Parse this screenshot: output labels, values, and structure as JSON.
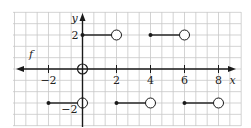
{
  "chart_data": {
    "type": "line",
    "title": "",
    "function_label": "f",
    "xlabel": "x",
    "ylabel": "y",
    "xlim": [
      -3.8,
      9.2
    ],
    "ylim": [
      -3.3,
      3.3
    ],
    "grid": true,
    "grid_step_units": 0.6667,
    "x_ticks": [
      -2,
      2,
      4,
      6,
      8
    ],
    "x_tick_labels": [
      "−2",
      "2",
      "4",
      "6",
      "8"
    ],
    "y_ticks": [
      2,
      -2
    ],
    "y_tick_labels": [
      "2",
      "−2"
    ],
    "segments": [
      {
        "x_start": -2,
        "x_end": 0,
        "y": -2,
        "start_closed": true,
        "end_closed": false
      },
      {
        "x_start": 0,
        "x_end": 2,
        "y": 2,
        "start_closed": true,
        "end_closed": false
      },
      {
        "x_start": 2,
        "x_end": 4,
        "y": -2,
        "start_closed": true,
        "end_closed": false
      },
      {
        "x_start": 4,
        "x_end": 6,
        "y": 2,
        "start_closed": true,
        "end_closed": false
      },
      {
        "x_start": 6,
        "x_end": 8,
        "y": -2,
        "start_closed": true,
        "end_closed": false
      }
    ],
    "extra_points": [
      {
        "x": 0,
        "y": 0,
        "closed": false
      }
    ],
    "colors": {
      "grid": "#c8c8c8",
      "axis": "#1a1a1a",
      "curve": "#1a1a1a"
    }
  }
}
